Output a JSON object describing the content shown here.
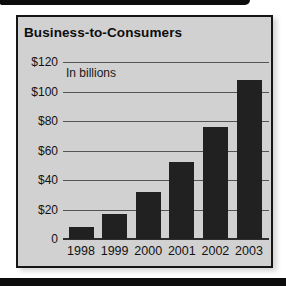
{
  "chart_data": {
    "type": "bar",
    "title": "Business-to-Consumers",
    "units_note": "In billions",
    "categories": [
      "1998",
      "1999",
      "2000",
      "2001",
      "2002",
      "2003"
    ],
    "values": [
      8,
      17,
      32,
      52,
      76,
      108
    ],
    "y_ticks": [
      0,
      20,
      40,
      60,
      80,
      100,
      120
    ],
    "y_tick_labels": [
      "0",
      "$20",
      "$40",
      "$60",
      "$80",
      "$100",
      "$120"
    ],
    "ylim": [
      0,
      120
    ],
    "xlabel": "",
    "ylabel": "",
    "grid": "on",
    "legend": "none",
    "bar_color": "#212121",
    "panel_bg": "#d1d1d1",
    "grid_color": "#555555",
    "baseline_color": "#2e2e2e",
    "rule_bar_color": "#0c0c0c"
  }
}
